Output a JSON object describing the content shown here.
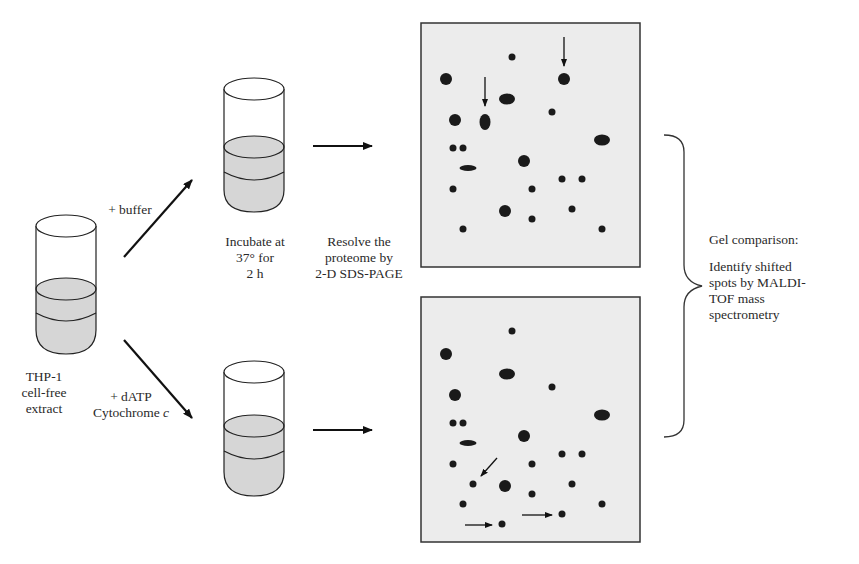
{
  "diagram": {
    "start_tube": {
      "label_lines": [
        "THP-1",
        "cell-free",
        "extract"
      ]
    },
    "branches": [
      {
        "id": "control",
        "label_lines": [
          "+ buffer"
        ]
      },
      {
        "id": "treated",
        "label_lines": [
          "+ dATP",
          "Cytochrome c"
        ]
      }
    ],
    "incubate_label": [
      "Incubate at",
      "37° for",
      "2 h"
    ],
    "resolve_label": [
      "Resolve the",
      "proteome by",
      "2-D SDS-PAGE"
    ],
    "comparison": {
      "title": "Gel comparison:",
      "detail_lines": [
        "Identify shifted",
        "spots by MALDI-",
        "TOF mass",
        "spectrometry"
      ]
    },
    "colors": {
      "gel_bg": "#ececec",
      "spot": "#1a1a1a",
      "tube_fill": "#d6d6d6",
      "stroke": "#222222"
    }
  }
}
